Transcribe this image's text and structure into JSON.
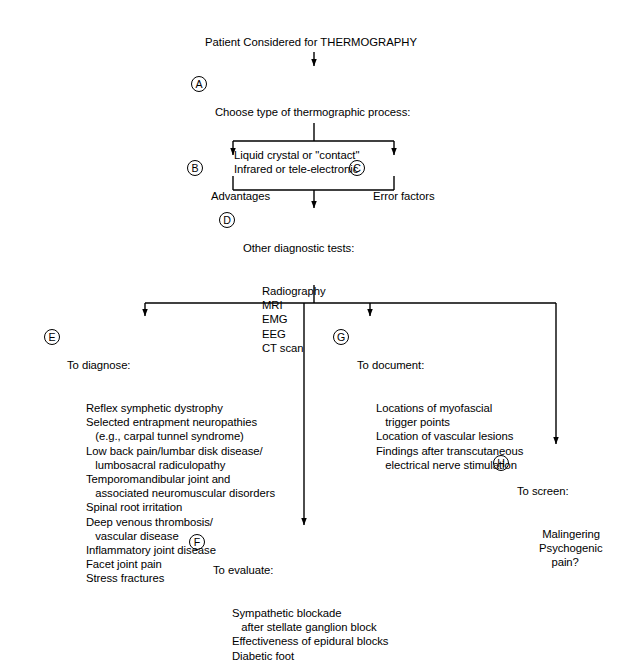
{
  "diagram": {
    "title": "Patient Considered for THERMOGRAPHY",
    "nodes": {
      "a": {
        "marker": "A",
        "heading": "Choose type of thermographic process:",
        "lines": [
          "Liquid crystal or \"contact\"",
          "Infrared or tele-electronic"
        ]
      },
      "b": {
        "marker": "B",
        "heading": "Advantages",
        "lines": []
      },
      "c": {
        "marker": "C",
        "heading": "Error factors",
        "lines": []
      },
      "d": {
        "marker": "D",
        "heading": "Other diagnostic tests:",
        "lines": [
          "Radiography",
          "MRI",
          "EMG",
          "EEG",
          "CT scan"
        ]
      },
      "e": {
        "marker": "E",
        "heading": "To diagnose:",
        "lines": [
          "Reflex symphetic dystrophy",
          "Selected entrapment neuropathies",
          "   (e.g., carpal tunnel syndrome)",
          "Low back pain/lumbar disk disease/",
          "   lumbosacral radiculopathy",
          "Temporomandibular joint and",
          "   associated neuromuscular disorders",
          "Spinal root irritation",
          "Deep venous thrombosis/",
          "   vascular disease",
          "Inflammatory joint disease",
          "Facet joint pain",
          "Stress fractures"
        ]
      },
      "f": {
        "marker": "F",
        "heading": "To evaluate:",
        "lines": [
          "Sympathetic blockade",
          "   after stellate ganglion block",
          "Effectiveness of epidural blocks",
          "Diabetic foot"
        ]
      },
      "g": {
        "marker": "G",
        "heading": "To document:",
        "lines": [
          "Locations of myofascial",
          "   trigger points",
          "Location of vascular lesions",
          "Findings after transcutaneous",
          "   electrical nerve stimulation"
        ]
      },
      "h": {
        "marker": "H",
        "heading": "To screen:",
        "lines": [
          "  Malingering",
          " Psychogenic",
          "     pain?"
        ]
      }
    },
    "colors": {
      "line": "#000000",
      "text": "#000000",
      "background": "#ffffff"
    }
  }
}
